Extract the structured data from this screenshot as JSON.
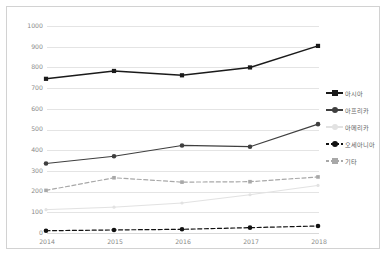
{
  "chart_data": {
    "type": "line",
    "title": "",
    "xlabel": "",
    "ylabel": "",
    "categories": [
      "2014",
      "2015",
      "2016",
      "2017",
      "2018"
    ],
    "ylim": [
      0,
      1000
    ],
    "yticks": [
      0,
      100,
      200,
      300,
      400,
      500,
      600,
      700,
      800,
      900,
      1000
    ],
    "ytick_labels": [
      "0",
      "100",
      "200",
      "300",
      "400",
      "500",
      "600",
      "700",
      "800",
      "900",
      "1000"
    ],
    "grid": true,
    "legend_position": "right",
    "series": [
      {
        "name": "아시아",
        "values": [
          740,
          778,
          757,
          795,
          899
        ],
        "color": "#1a1a1a",
        "marker": "square",
        "linestyle": "solid"
      },
      {
        "name": "아프리카",
        "values": [
          331,
          366,
          418,
          412,
          521
        ],
        "color": "#3f3f3f",
        "marker": "circle",
        "linestyle": "solid"
      },
      {
        "name": "아메리카",
        "values": [
          108,
          120,
          140,
          180,
          225
        ],
        "color": "#e2e2e2",
        "marker": "circle",
        "linestyle": "solid"
      },
      {
        "name": "오세아니아",
        "values": [
          6,
          10,
          13,
          21,
          29
        ],
        "color": "#111111",
        "marker": "circle",
        "linestyle": "dashed"
      },
      {
        "name": "기타",
        "values": [
          201,
          262,
          241,
          243,
          266
        ],
        "color": "#a8a8a8",
        "marker": "square",
        "linestyle": "dashed"
      }
    ]
  }
}
